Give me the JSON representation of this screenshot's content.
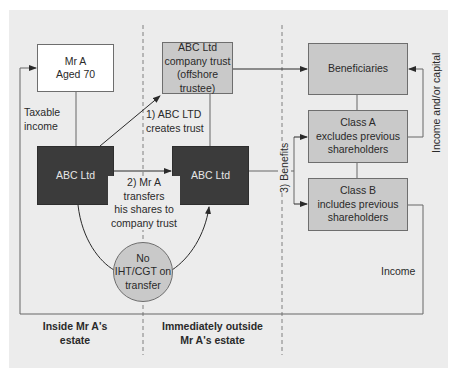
{
  "diagram": {
    "nodes": {
      "mr_a": "Mr A\nAged 70",
      "company_trust": "ABC Ltd\ncompany trust\n(offshore trustee)",
      "abc_ltd_inside": "ABC Ltd",
      "abc_ltd_outside": "ABC Ltd",
      "beneficiaries": "Beneficiaries",
      "class_a": "Class A\nexcludes previous\nshareholders",
      "class_b": "Class B\nincludes previous\nshareholders",
      "no_tax": "No\nIHT/CGT on\ntransfer"
    },
    "edge_labels": {
      "taxable_income": "Taxable\nincome",
      "step1": "1) ABC LTD\ncreates trust",
      "step2": "2) Mr A\ntransfers\nhis shares to\ncompany trust",
      "step3": "3) Benefits",
      "income_capital": "Income and/or capital",
      "income": "Income"
    },
    "zones": {
      "inside": "Inside Mr A's\nestate",
      "outside": "Immediately outside\nMr A's estate"
    },
    "colors": {
      "panel": "#ececec",
      "light_box": "#c9c9c9",
      "dark_box": "#3b3b3b",
      "white_box": "#ffffff",
      "line": "#555555"
    }
  }
}
